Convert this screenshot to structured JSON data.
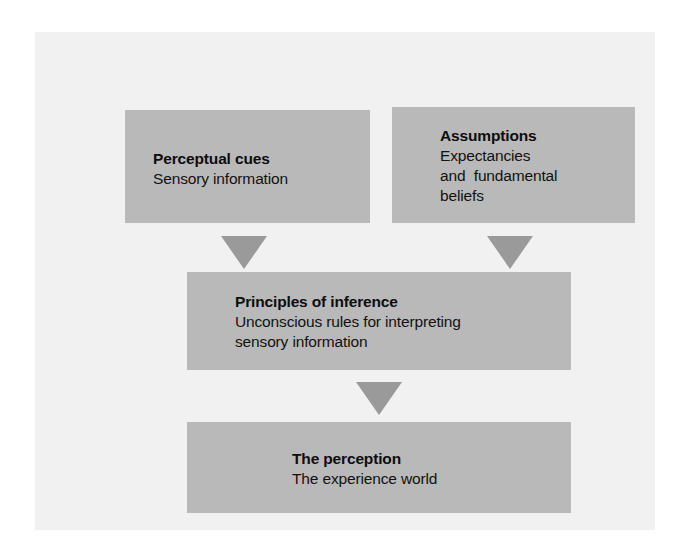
{
  "figure": {
    "kind": "flow-diagram",
    "orientation": "top-to-bottom",
    "background_color": "#ffffff",
    "panel_color": "#f1f1f1",
    "box_color": "#b9b9b9",
    "arrow_color": "#9a9a9a",
    "text_color": "#0d0d0d"
  },
  "nodes": {
    "perceptual_cues": {
      "title": "Perceptual cues",
      "lines": [
        "Sensory information"
      ]
    },
    "assumptions": {
      "title": "Assumptions",
      "lines": [
        "Expectancies",
        "and  fundamental",
        "beliefs"
      ]
    },
    "principles_of_inference": {
      "title": "Principles of inference",
      "lines": [
        "Unconscious rules for interpreting",
        "sensory information"
      ]
    },
    "the_perception": {
      "title": "The perception",
      "lines": [
        "The experience world"
      ]
    }
  },
  "arrows": [
    {
      "name": "cues-to-principles",
      "direction": "down"
    },
    {
      "name": "assumptions-to-principles",
      "direction": "down"
    },
    {
      "name": "principles-to-perception",
      "direction": "down"
    }
  ]
}
